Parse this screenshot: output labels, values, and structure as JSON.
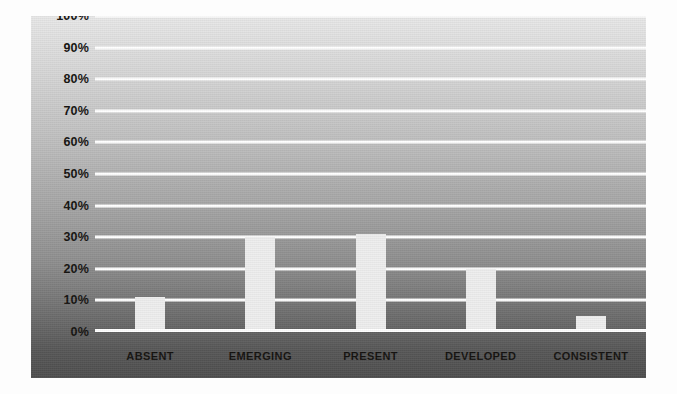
{
  "chart_data": {
    "type": "bar",
    "title": "",
    "subtitle": "",
    "xlabel": "",
    "ylabel": "",
    "categories": [
      "ABSENT",
      "EMERGING",
      "PRESENT",
      "DEVELOPED",
      "CONSISTENT"
    ],
    "values": [
      11,
      30,
      31,
      20,
      5
    ],
    "value_labels": [
      "11%",
      "30%",
      "31%",
      "20%",
      "5%"
    ],
    "ylim": [
      0,
      100
    ],
    "ytick_step": 10,
    "ytick_labels": [
      "100%",
      "90%",
      "80%",
      "70%",
      "60%",
      "50%",
      "40%",
      "30%",
      "20%",
      "10%",
      "0%"
    ],
    "ytick_values": [
      100,
      90,
      80,
      70,
      60,
      50,
      40,
      30,
      20,
      10,
      0
    ],
    "grid": true,
    "grid_color": "#ffffff",
    "legend": false,
    "legend_position": "none",
    "bar_color": "#eeeeee",
    "background_top_color": "#e8e8e8",
    "background_bottom_color": "#4e4e4e",
    "axis_label_color": "#14120f"
  }
}
